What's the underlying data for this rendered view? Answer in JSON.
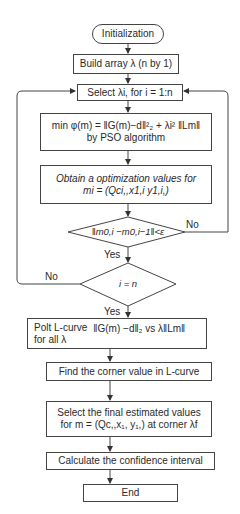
{
  "diagram": {
    "type": "flowchart",
    "nodes": {
      "start": {
        "label": "Initialization",
        "shape": "rounded"
      },
      "build": {
        "label": "Build array λ (n by 1)",
        "shape": "rect"
      },
      "select": {
        "label": "Select λi, for i = 1:n",
        "shape": "rect"
      },
      "minimize": {
        "line1": "min φ(m) = ‖G(m)−d‖²₂ + λi² ‖Lm‖",
        "line2": "by PSO algorithm",
        "shape": "rect"
      },
      "obtain": {
        "line1": "Obtain a optimization values for",
        "line2": "mi = (Qci,,x1,i y1,i,)",
        "shape": "rect"
      },
      "check1": {
        "label": "‖m0,i −m0,i−1‖<ε",
        "shape": "diamond"
      },
      "check2": {
        "label": "i = n",
        "shape": "diamond"
      },
      "plot": {
        "line1": "Polt L-curve",
        "line2": "for all λ",
        "formula": "‖G(m) −d‖₂ vs λ‖Lm‖",
        "shape": "rect"
      },
      "corner": {
        "label": "Find the corner value in L-curve",
        "shape": "rect"
      },
      "final": {
        "line1": "Select the final estimated values",
        "line2": "for m = (Qc,,x₁, y₁,) at corner λf",
        "shape": "rect"
      },
      "confidence": {
        "label": "Calculate the confidence interval",
        "shape": "rect"
      },
      "end": {
        "label": "End",
        "shape": "rect"
      }
    },
    "edges": [
      {
        "from": "start",
        "to": "build"
      },
      {
        "from": "build",
        "to": "select"
      },
      {
        "from": "select",
        "to": "minimize"
      },
      {
        "from": "minimize",
        "to": "obtain"
      },
      {
        "from": "obtain",
        "to": "check1"
      },
      {
        "from": "check1",
        "to": "check2",
        "label": "Yes"
      },
      {
        "from": "check1",
        "to": "select",
        "label": "No"
      },
      {
        "from": "check2",
        "to": "plot",
        "label": "Yes"
      },
      {
        "from": "check2",
        "to": "select",
        "label": "No"
      },
      {
        "from": "plot",
        "to": "corner"
      },
      {
        "from": "corner",
        "to": "final"
      },
      {
        "from": "final",
        "to": "confidence"
      },
      {
        "from": "confidence",
        "to": "end"
      }
    ],
    "labels": {
      "yes": "Yes",
      "no": "No"
    }
  }
}
